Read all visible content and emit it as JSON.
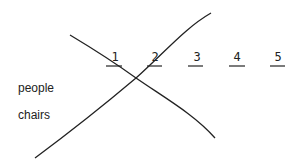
{
  "slots": [
    {
      "label": "1",
      "x": 107,
      "y": 51,
      "line_x1": 106,
      "line_x2": 122
    },
    {
      "label": "2",
      "x": 147,
      "y": 51,
      "line_x1": 147,
      "line_x2": 162
    },
    {
      "label": "3",
      "x": 189,
      "y": 51,
      "line_x1": 188,
      "line_x2": 203
    },
    {
      "label": "4",
      "x": 229,
      "y": 51,
      "line_x1": 229,
      "line_x2": 245
    },
    {
      "label": "5",
      "x": 270,
      "y": 51,
      "line_x1": 270,
      "line_x2": 285
    }
  ],
  "row_labels": [
    {
      "text": "people",
      "x": 18,
      "y": 81
    },
    {
      "text": "chairs",
      "x": 18,
      "y": 108
    }
  ],
  "curves": {
    "rising": "M35,158 C70,132 110,100 136,78 C165,52 185,28 211,13",
    "falling": "M70,35 C95,50 118,65 136,78 C165,98 195,115 215,138"
  },
  "colors": {
    "ink": "#222222",
    "background": "#ffffff"
  }
}
